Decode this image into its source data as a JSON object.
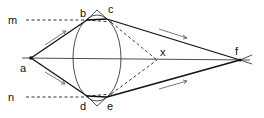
{
  "diagram": {
    "labels": {
      "a": "a",
      "b": "b",
      "c": "c",
      "d": "d",
      "e": "e",
      "f": "f",
      "x": "x",
      "m": "m",
      "n": "n"
    },
    "colors": {
      "line": "#111111",
      "background": "#ffffff"
    }
  }
}
